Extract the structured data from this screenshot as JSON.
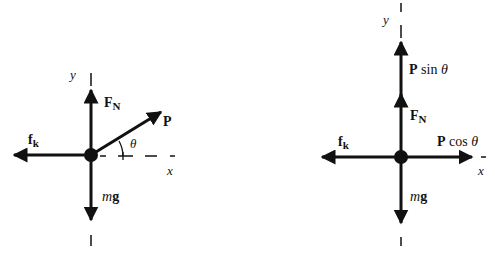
{
  "left_diagram": {
    "axis_x": "x",
    "axis_y": "y",
    "forces": {
      "normal": {
        "main": "F",
        "sub": "N"
      },
      "friction": {
        "main": "f",
        "sub": "k"
      },
      "applied": "P",
      "weight_m": "m",
      "weight_g": "g"
    },
    "angle": "θ"
  },
  "right_diagram": {
    "axis_x": "x",
    "axis_y": "y",
    "forces": {
      "normal": {
        "main": "F",
        "sub": "N"
      },
      "friction": {
        "main": "f",
        "sub": "k"
      },
      "p_sin_bold": "P",
      "p_sin_rest": " sin ",
      "p_cos_bold": "P",
      "p_cos_rest": " cos ",
      "theta": "θ",
      "weight_m": "m",
      "weight_g": "g"
    }
  },
  "colors": {
    "ink": "#111111",
    "background": "#ffffff"
  }
}
